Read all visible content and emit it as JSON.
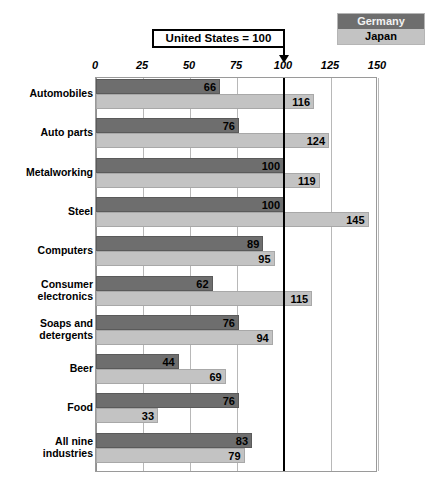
{
  "legend": {
    "items": [
      {
        "label": "Germany",
        "color": "#6e6e6e"
      },
      {
        "label": "Japan",
        "color": "#c3c3c3"
      }
    ]
  },
  "callout": {
    "text": "United States = 100",
    "points_to": 100
  },
  "chart_data": {
    "type": "bar",
    "orientation": "horizontal",
    "title": "",
    "subtitle": "",
    "xlabel": "",
    "ylabel": "",
    "xlim": [
      0,
      150
    ],
    "ticks": [
      0,
      25,
      50,
      75,
      100,
      125,
      150
    ],
    "grid": true,
    "reference_line": {
      "value": 100,
      "label": "United States = 100"
    },
    "legend_position": "top-right",
    "categories": [
      "Automobiles",
      "Auto parts",
      "Metalworking",
      "Steel",
      "Computers",
      "Consumer electronics",
      "Soaps and detergents",
      "Beer",
      "Food",
      "All nine industries"
    ],
    "category_lines": [
      [
        "Automobiles"
      ],
      [
        "Auto parts"
      ],
      [
        "Metalworking"
      ],
      [
        "Steel"
      ],
      [
        "Computers"
      ],
      [
        "Consumer",
        "electronics"
      ],
      [
        "Soaps and",
        "detergents"
      ],
      [
        "Beer"
      ],
      [
        "Food"
      ],
      [
        "All nine",
        "industries"
      ]
    ],
    "series": [
      {
        "name": "Germany",
        "color": "#6e6e6e",
        "values": [
          66,
          76,
          100,
          100,
          89,
          62,
          76,
          44,
          76,
          83
        ]
      },
      {
        "name": "Japan",
        "color": "#c3c3c3",
        "values": [
          116,
          124,
          119,
          145,
          95,
          115,
          94,
          69,
          33,
          79
        ]
      }
    ]
  },
  "ticks_text": [
    "0",
    "25",
    "50",
    "75",
    "100",
    "125",
    "150"
  ]
}
